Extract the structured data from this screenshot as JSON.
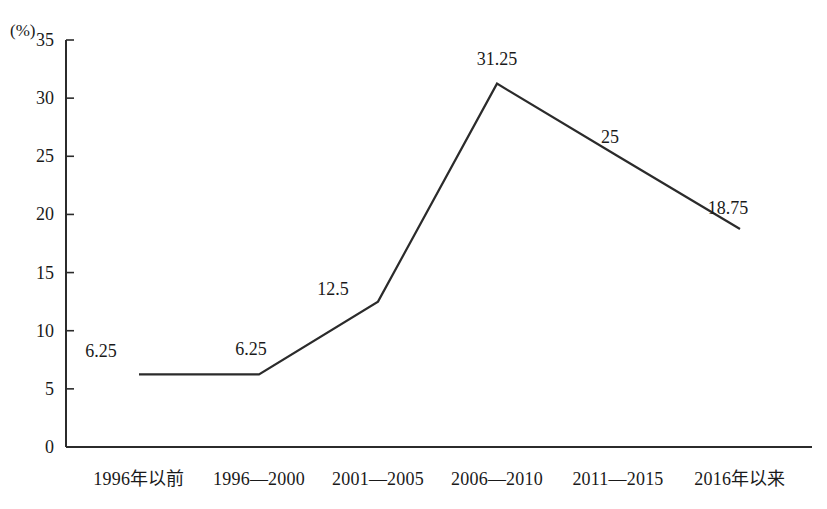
{
  "chart_data": {
    "type": "line",
    "title": "",
    "subtitle": "",
    "xlabel": "",
    "ylabel": "",
    "unit_label": "(%)",
    "categories": [
      "1996年以前",
      "1996—2000",
      "2001—2005",
      "2006—2010",
      "2011—2015",
      "2016年以来"
    ],
    "values": [
      6.25,
      6.25,
      12.5,
      31.25,
      25,
      18.75
    ],
    "point_labels": [
      "6.25",
      "6.25",
      "12.5",
      "31.25",
      "25",
      "18.75"
    ],
    "ylim": [
      0,
      35
    ],
    "ytick_values": [
      0,
      5,
      10,
      15,
      20,
      25,
      30,
      35
    ],
    "ytick_labels": [
      "0",
      "5",
      "10",
      "15",
      "20",
      "25",
      "30",
      "35"
    ],
    "grid": false,
    "legend": false,
    "legend_position": "none",
    "series": [
      {
        "name": "",
        "values": [
          6.25,
          6.25,
          12.5,
          31.25,
          25,
          18.75
        ]
      }
    ],
    "colors": {
      "line": "#2b2b2b",
      "axis": "#2b2b2b",
      "text": "#1a1a1a",
      "background": "#ffffff"
    }
  }
}
